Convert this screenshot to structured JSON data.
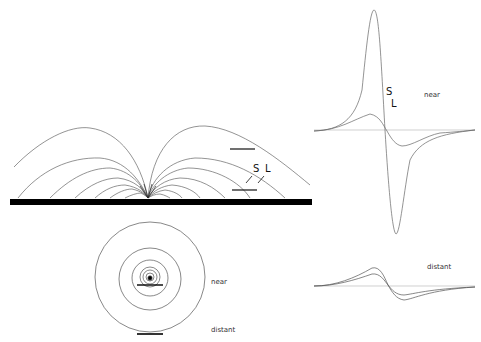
{
  "figure": {
    "panels": {
      "field_lines": {
        "description": "Dipole field lines converging to a point on a thick horizontal conductor",
        "labels": {
          "S": "S",
          "L": "L"
        }
      },
      "concentric_field": {
        "description": "Concentric field rings around a source, with near and distant electrodes",
        "labels": {
          "near": "near",
          "distant": "distant"
        }
      },
      "waveform_near": {
        "description": "Biphasic waveforms for short (S) and long (L) electrodes recorded near",
        "labels": {
          "S": "S",
          "L": "L",
          "condition": "near"
        }
      },
      "waveform_distant": {
        "description": "Biphasic waveforms recorded distant",
        "labels": {
          "condition": "distant"
        }
      }
    },
    "colors": {
      "line": "#555555",
      "bar": "#000000",
      "background": "#ffffff"
    }
  }
}
